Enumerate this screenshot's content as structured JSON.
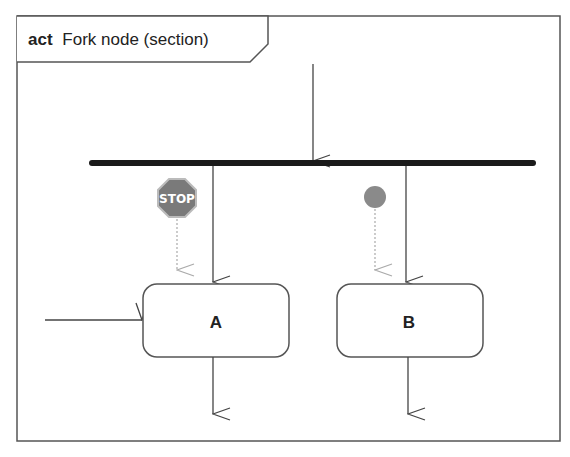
{
  "diagram": {
    "type": "UML activity diagram",
    "frame": {
      "keyword": "act",
      "title": "Fork node (section)"
    },
    "fork_node": {
      "incoming_flows": 1,
      "outgoing_flows": 2
    },
    "actions": [
      {
        "id": "A",
        "label": "A"
      },
      {
        "id": "B",
        "label": "B"
      }
    ],
    "tokens": [
      {
        "name": "stop-sign",
        "text": "STOP",
        "near": "A",
        "color": "#7a7a7a"
      },
      {
        "name": "token-dot",
        "near": "B",
        "color": "#8a8a8a"
      }
    ],
    "edges": [
      {
        "from": "incoming",
        "to": "fork"
      },
      {
        "from": "fork",
        "to": "A"
      },
      {
        "from": "fork",
        "to": "B"
      },
      {
        "from": "external",
        "to": "A"
      },
      {
        "from": "A",
        "to": "outgoing"
      },
      {
        "from": "B",
        "to": "outgoing"
      }
    ],
    "colors": {
      "line": "#444444",
      "fork_bar": "#1a1a1a",
      "token_arrow": "#aaaaaa"
    }
  }
}
